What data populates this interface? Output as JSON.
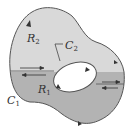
{
  "diagram": {
    "type": "region-with-hole",
    "colors": {
      "region_upper_fill": "#d9d9d9",
      "region_lower_fill": "#b3b3b3",
      "boundary_stroke": "#555555",
      "hole_fill": "#ffffff",
      "arrow_color": "#333333"
    },
    "labels": {
      "R2": {
        "main": "R",
        "sub": "2"
      },
      "R1": {
        "main": "R",
        "sub": "1"
      },
      "C2": {
        "main": "C",
        "sub": "2"
      },
      "C1": {
        "main": "C",
        "sub": "1"
      }
    },
    "regions": [
      {
        "id": "R2",
        "position": "upper"
      },
      {
        "id": "R1",
        "position": "lower"
      }
    ],
    "curves": [
      {
        "id": "C1",
        "role": "outer boundary",
        "orientation": "counterclockwise"
      },
      {
        "id": "C2",
        "role": "inner boundary (hole)",
        "orientation": "clockwise"
      }
    ],
    "cut_segments": [
      {
        "side": "left",
        "arrows": [
          "right (upper)",
          "left (lower)"
        ]
      },
      {
        "side": "right",
        "arrows": [
          "right (upper)",
          "left (lower)"
        ]
      }
    ]
  }
}
